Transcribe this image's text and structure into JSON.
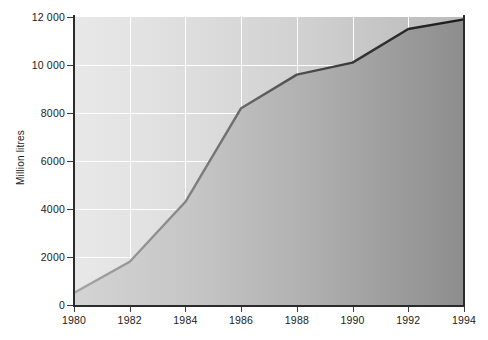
{
  "chart_data": {
    "type": "area",
    "title": "",
    "subtitle": "",
    "xlabel": "",
    "ylabel": "Million litres",
    "x": [
      1980,
      1982,
      1984,
      1986,
      1988,
      1990,
      1992,
      1994
    ],
    "values": [
      500,
      1800,
      4300,
      8200,
      9600,
      10100,
      11500,
      11900
    ],
    "series": [
      {
        "name": "Million litres",
        "values": [
          500,
          1800,
          4300,
          8200,
          9600,
          10100,
          11500,
          11900
        ]
      }
    ],
    "xtick_labels": [
      "1980",
      "1982",
      "1984",
      "1986",
      "1988",
      "1990",
      "1992",
      "1994"
    ],
    "ytick_labels": [
      "0",
      "2000",
      "4000",
      "6000",
      "8000",
      "10 000",
      "12 000"
    ],
    "ytick_values": [
      0,
      2000,
      4000,
      6000,
      8000,
      10000,
      12000
    ],
    "xlim": [
      1980,
      1994
    ],
    "ylim": [
      0,
      12000
    ],
    "grid": true,
    "legend": false,
    "legend_position": "none",
    "colors": {
      "line_start": "#9a9a9a",
      "line_end": "#1f1f1f",
      "fill_start": "#d2d2d2",
      "fill_end": "#8e8e8e",
      "background_start": "#e8e8e8",
      "background_end": "#bbbbbb",
      "gridline": "#ffffff",
      "axis": "#2b2b2b",
      "text": "#1a1a1a"
    }
  }
}
